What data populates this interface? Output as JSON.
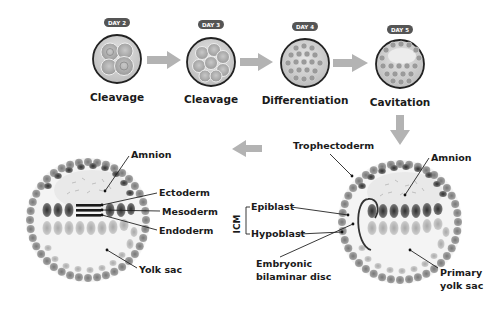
{
  "colors": {
    "arrow": "#b3b3b3",
    "badge": "#555555",
    "outline": "#222222",
    "cell_dark": "#4a4a4a",
    "cell_mid": "#8a8a8a",
    "cell_light": "#b8b8b8",
    "cavity": "#f2f2f2"
  },
  "stages": [
    {
      "day": "DAY 2",
      "label": "Cleavage"
    },
    {
      "day": "DAY 3",
      "label": "Cleavage"
    },
    {
      "day": "DAY 4",
      "label": "Differentiation"
    },
    {
      "day": "DAY 5",
      "label": "Cavitation"
    }
  ],
  "bilaminar": {
    "trophectoderm": "Trophectoderm",
    "amnion": "Amnion",
    "icm": "ICM",
    "epiblast": "Epiblast",
    "hypoblast": "Hypoblast",
    "disc_line1": "Embryonic",
    "disc_line2": "bilaminar disc",
    "yolk_line1": "Primary",
    "yolk_line2": "yolk sac"
  },
  "trilaminar": {
    "amnion": "Amnion",
    "ectoderm": "Ectoderm",
    "mesoderm": "Mesoderm",
    "endoderm": "Endoderm",
    "yolk_sac": "Yolk sac"
  }
}
